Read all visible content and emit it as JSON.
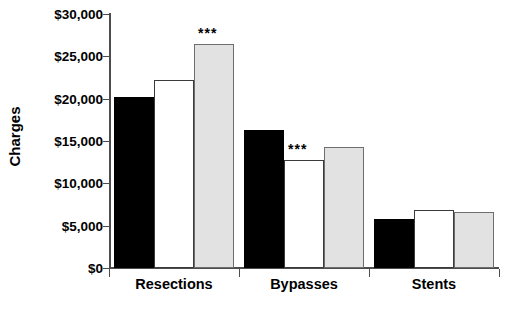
{
  "chart_data": {
    "type": "bar",
    "title": "",
    "xlabel": "",
    "ylabel": "Charges",
    "categories": [
      "Resections",
      "Bypasses",
      "Stents"
    ],
    "ylim": [
      0,
      30000
    ],
    "ytick_values": [
      0,
      5000,
      10000,
      15000,
      20000,
      25000,
      30000
    ],
    "ytick_labels": [
      "$0",
      "$5,000",
      "$10,000",
      "$15,000",
      "$20,000",
      "$25,000",
      "$30,000"
    ],
    "grid": false,
    "legend": "none",
    "series": [
      {
        "name": "black",
        "color": "#000000",
        "values": [
          20200,
          16300,
          5800
        ]
      },
      {
        "name": "white",
        "color": "#ffffff",
        "values": [
          22200,
          12750,
          6900
        ]
      },
      {
        "name": "gray",
        "color": "#e2e2e2",
        "values": [
          26500,
          14350,
          6600
        ]
      }
    ],
    "annotations": [
      {
        "text": "***",
        "category": "Resections",
        "series": "gray",
        "value": 26500
      },
      {
        "text": "***",
        "category": "Bypasses",
        "series": "white",
        "value": 12750
      }
    ]
  }
}
